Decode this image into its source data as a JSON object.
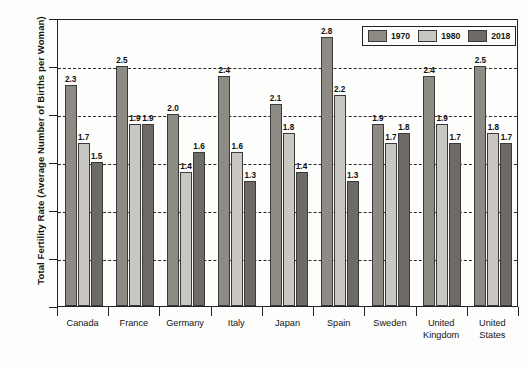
{
  "chart_data": {
    "type": "bar",
    "title": "",
    "xlabel": "",
    "ylabel": "Total Fertility Rate (Average Number of Births per Woman)",
    "ylim": [
      0.0,
      3.0
    ],
    "ytick_labels": [
      "0.0",
      "0.5",
      "1.0",
      "1.5",
      "2.0",
      "2.5",
      "3.0"
    ],
    "ytick_values": [
      0.0,
      0.5,
      1.0,
      1.5,
      2.0,
      2.5,
      3.0
    ],
    "grid": "horizontal-dashed",
    "legend_position": "top-right-inside",
    "categories": [
      "Canada",
      "France",
      "Germany",
      "Italy",
      "Japan",
      "Spain",
      "Sweden",
      "United Kingdom",
      "United States"
    ],
    "series": [
      {
        "name": "1970",
        "color": "#8e8a84",
        "values": [
          2.3,
          2.5,
          2.0,
          2.4,
          2.1,
          2.8,
          1.9,
          2.4,
          2.5
        ],
        "labels": [
          "2.3",
          "2.5",
          "2.0",
          "2.4",
          "2.1",
          "2.8",
          "1.9",
          "2.4",
          "2.5"
        ]
      },
      {
        "name": "1980",
        "color": "#c9c7c2",
        "values": [
          1.7,
          1.9,
          1.4,
          1.6,
          1.8,
          2.2,
          1.7,
          1.9,
          1.8
        ],
        "labels": [
          "1.7",
          "1.9",
          "1.4",
          "1.6",
          "1.8",
          "2.2",
          "1.7",
          "1.9",
          "1.8"
        ]
      },
      {
        "name": "2018",
        "color": "#6e6a66",
        "values": [
          1.5,
          1.9,
          1.6,
          1.3,
          1.4,
          1.3,
          1.8,
          1.7,
          1.7
        ],
        "labels": [
          "1.5",
          "1.9",
          "1.6",
          "1.3",
          "1.4",
          "1.3",
          "1.8",
          "1.7",
          "1.7"
        ]
      }
    ]
  },
  "legend": {
    "items": [
      {
        "label": "1970"
      },
      {
        "label": "1980"
      },
      {
        "label": "2018"
      }
    ]
  }
}
